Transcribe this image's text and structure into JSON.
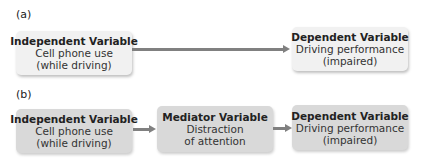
{
  "panels": [
    {
      "label": "(a)",
      "boxes": [
        {
          "title": "Independent Variable",
          "line1": "Cell phone use",
          "line2": "(while driving)"
        },
        {
          "title": "Dependent Variable",
          "line1": "Driving performance",
          "line2": "(impaired)"
        }
      ]
    },
    {
      "label": "(b)",
      "boxes": [
        {
          "title": "Independent Variable",
          "line1": "Cell phone use",
          "line2": "(while driving)"
        },
        {
          "title": "Mediator Variable",
          "line1": "Distraction",
          "line2": "of attention"
        },
        {
          "title": "Dependent Variable",
          "line1": "Driving performance",
          "line2": "(impaired)"
        }
      ]
    }
  ],
  "colors": {
    "panel_a_box": "#f1f1f1",
    "panel_b_box": "#d9d9d9",
    "arrow": "#808080"
  }
}
